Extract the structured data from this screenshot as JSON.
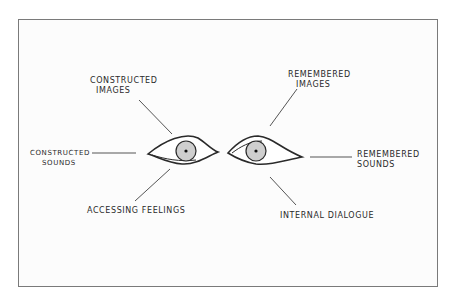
{
  "diagram": {
    "labels": {
      "constructed_images": [
        "Constructed",
        "Images"
      ],
      "remembered_images": [
        "Remembered",
        "Images"
      ],
      "constructed_sounds": [
        "Constructed",
        "Sounds"
      ],
      "remembered_sounds": [
        "Remembered",
        "Sounds"
      ],
      "accessing_feelings": "Accessing Feelings",
      "internal_dialogue": "Internal Dialogue"
    },
    "colors": {
      "line": "#555555",
      "eye_outline": "#2a2a2a",
      "iris": "#cfcfcf",
      "frame": "#7a7a7a"
    }
  }
}
